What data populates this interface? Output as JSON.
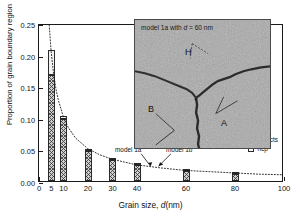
{
  "chart_data": {
    "type": "bar",
    "title": "",
    "xlabel": "Grain size, d (nm)",
    "ylabel": "Proportion of grain boundary region",
    "xlim": [
      0,
      100
    ],
    "ylim": [
      0.0,
      0.25
    ],
    "xticks": [
      "0",
      "5",
      "10",
      "20",
      "30",
      "40",
      "60",
      "80",
      "100"
    ],
    "xtick_values": [
      0,
      5,
      10,
      20,
      30,
      40,
      60,
      80,
      100
    ],
    "yticks": [
      "0.00",
      "0.05",
      "0.10",
      "0.15",
      "0.20",
      "0.25"
    ],
    "ytick_values": [
      0.0,
      0.05,
      0.1,
      0.15,
      0.2,
      0.25
    ],
    "grid": false,
    "legend_position": "bottom-right",
    "categories": [
      5,
      10,
      20,
      30,
      40,
      60,
      80
    ],
    "series": [
      {
        "name": "defects",
        "values": [
          0.168,
          0.098,
          0.048,
          0.034,
          0.025,
          0.016,
          0.011
        ]
      },
      {
        "name": "hcp",
        "values": [
          0.039,
          0.005,
          0.002,
          0.001,
          0.001,
          0.001,
          0.001
        ]
      }
    ],
    "stacked_totals": [
      0.207,
      0.103,
      0.05,
      0.035,
      0.026,
      0.017,
      0.012
    ],
    "fit_curve": {
      "style": "dotted",
      "x": [
        4.2,
        5,
        6,
        7,
        8,
        10,
        12,
        15,
        20,
        25,
        30,
        40,
        50,
        60,
        70,
        80,
        90,
        100
      ],
      "y": [
        0.25,
        0.207,
        0.172,
        0.147,
        0.129,
        0.103,
        0.086,
        0.069,
        0.052,
        0.042,
        0.035,
        0.026,
        0.021,
        0.017,
        0.015,
        0.013,
        0.011,
        0.01
      ]
    },
    "annotations": [
      {
        "text": "model 1a",
        "target_x": 60,
        "target_y": 0.017
      },
      {
        "text": "model 1b",
        "target_x": 60,
        "target_y": 0.017
      }
    ]
  },
  "legend": {
    "items": [
      {
        "label": "defects",
        "swatch": "hatched"
      },
      {
        "label": "hcp",
        "swatch": "open"
      }
    ]
  },
  "inset": {
    "title_prefix": "model 1a with ",
    "title_italic": "d",
    "title_suffix": " = 60 nm",
    "grain_labels": [
      {
        "label": "H",
        "position": "top-center"
      },
      {
        "label": "B",
        "position": "left"
      },
      {
        "label": "A",
        "position": "right"
      }
    ]
  }
}
